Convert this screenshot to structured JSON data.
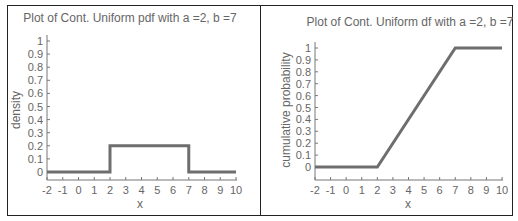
{
  "chart_data": [
    {
      "type": "line",
      "title": "Plot of Cont. Uniform pdf with a =2, b =7",
      "xlabel": "x",
      "ylabel": "density",
      "xlim": [
        -2,
        10
      ],
      "ylim": [
        0,
        1
      ],
      "x_ticks": [
        -2,
        -1,
        0,
        1,
        2,
        3,
        4,
        5,
        6,
        7,
        8,
        9,
        10
      ],
      "y_ticks": [
        0,
        0.1,
        0.2,
        0.3,
        0.4,
        0.5,
        0.6,
        0.7,
        0.8,
        0.9,
        1
      ],
      "y_tick_labels": [
        "0",
        "0.1",
        "0.2",
        "0.3",
        "0.4",
        "0.5",
        "0.6",
        "0.7",
        "0.8",
        "0.9",
        "1"
      ],
      "grid": false,
      "series": [
        {
          "name": "pdf",
          "x": [
            -2,
            2,
            2,
            7,
            7,
            10
          ],
          "y": [
            0,
            0,
            0.2,
            0.2,
            0,
            0
          ]
        }
      ],
      "line_color": "#6e6e6e"
    },
    {
      "type": "line",
      "title": "Plot of Cont. Uniform df with a =2, b =7",
      "xlabel": "x",
      "ylabel": "cumulative probability",
      "xlim": [
        -2,
        10
      ],
      "ylim": [
        0,
        1
      ],
      "x_ticks": [
        -2,
        -1,
        0,
        1,
        2,
        3,
        4,
        5,
        6,
        7,
        8,
        9,
        10
      ],
      "y_ticks": [
        0,
        0.1,
        0.2,
        0.3,
        0.4,
        0.5,
        0.6,
        0.7,
        0.8,
        0.9,
        1
      ],
      "y_tick_labels": [
        "0",
        "0.1",
        "0.2",
        "0.3",
        "0.4",
        "0.5",
        "0.6",
        "0.7",
        "0.8",
        "0.9",
        "1"
      ],
      "grid": false,
      "series": [
        {
          "name": "cdf",
          "x": [
            -2,
            2,
            7,
            10
          ],
          "y": [
            0,
            0,
            1,
            1
          ]
        }
      ],
      "line_color": "#6e6e6e"
    }
  ],
  "left": {
    "title": "Plot of Cont. Uniform pdf with a =2, b =7",
    "xlabel": "x",
    "ylabel": "density"
  },
  "right": {
    "title": "Plot of Cont. Uniform df with a =2, b =7",
    "xlabel": "x",
    "ylabel": "cumulative probability"
  }
}
